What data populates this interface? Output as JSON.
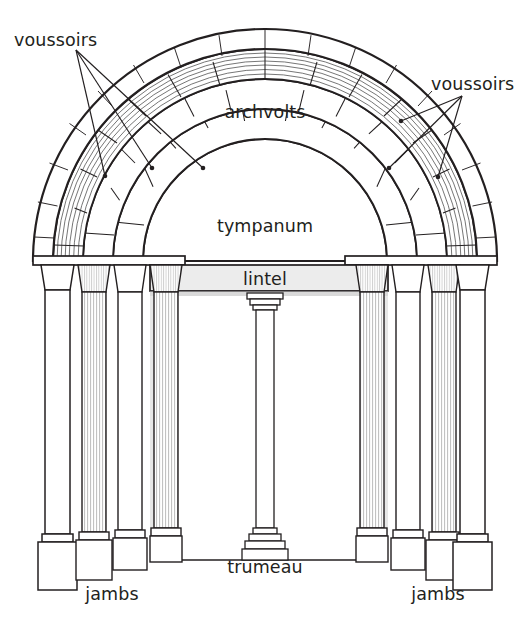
{
  "diagram": {
    "background_color": "#ffffff",
    "stroke_color": "#231f20",
    "shade_color": "#e2e2e2",
    "flute_color": "#b9b9b9",
    "labels": {
      "voussoirs_left": "voussoirs",
      "voussoirs_right": "voussoirs",
      "archvolts": "archvolts",
      "tympanum": "tympanum",
      "lintel": "lintel",
      "trumeau": "trumeau",
      "jambs_left": "jambs",
      "jambs_right": "jambs"
    }
  },
  "geometry": {
    "arch_center_x": 265,
    "arch_center_y": 261,
    "impost_y": 261,
    "ground_y": 560,
    "ring_radii": [
      122,
      152,
      182,
      212,
      232
    ],
    "ring_voussoir_counts": [
      11,
      13,
      15,
      0
    ],
    "left_columns_x": [
      60,
      95,
      130,
      165
    ],
    "right_columns_x": [
      470,
      435,
      400,
      365
    ],
    "trumeau_x": 265
  },
  "leaders": {
    "left": [
      {
        "from_x": 76,
        "from_y": 48,
        "to_x": 104,
        "to_y": 176
      },
      {
        "from_x": 76,
        "from_y": 48,
        "to_x": 152,
        "to_y": 168
      },
      {
        "from_x": 76,
        "from_y": 48,
        "to_x": 203,
        "to_y": 168
      }
    ],
    "right": [
      {
        "from_x": 461,
        "from_y": 96,
        "to_x": 401,
        "to_y": 120
      },
      {
        "from_x": 461,
        "from_y": 96,
        "to_x": 389,
        "to_y": 167
      },
      {
        "from_x": 461,
        "from_y": 96,
        "to_x": 438,
        "to_y": 176
      }
    ]
  }
}
